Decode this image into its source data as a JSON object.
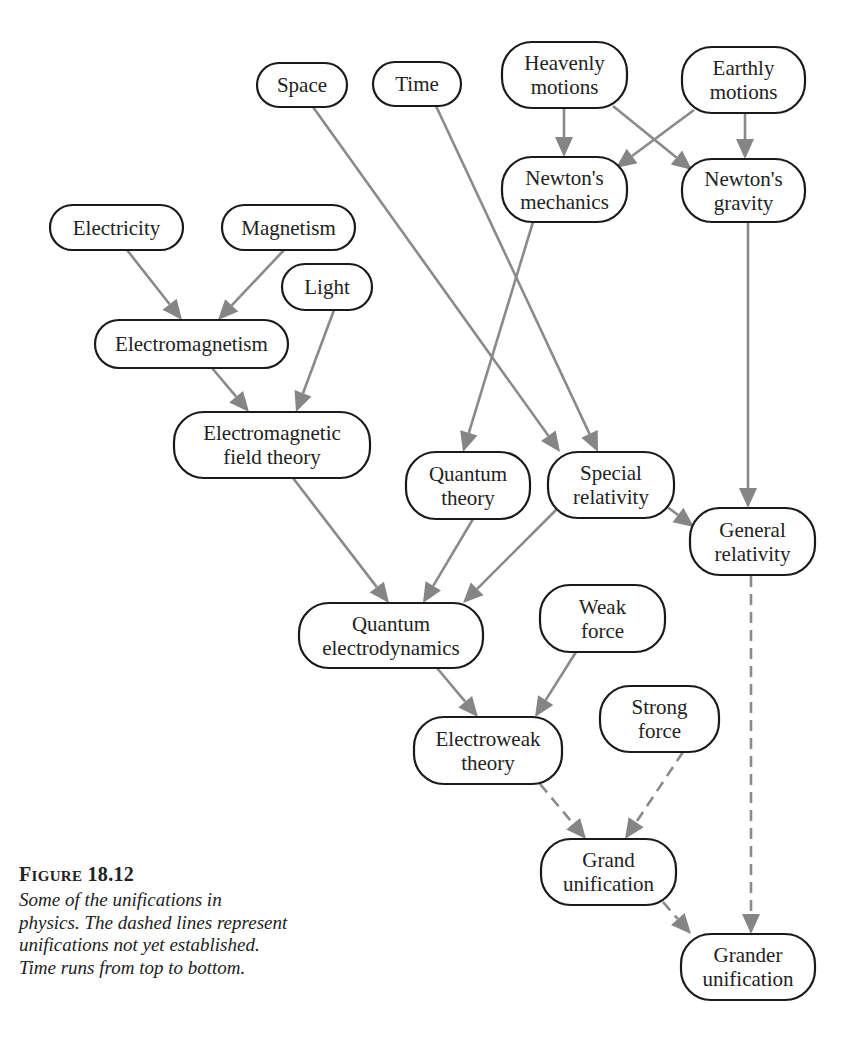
{
  "diagram": {
    "title": "Unifications in physics",
    "edge_color": "#858585",
    "node_border_color": "#1a1a1a",
    "nodes": [
      {
        "id": "space",
        "lines": [
          "Space"
        ],
        "x": 257,
        "y": 63,
        "w": 90,
        "h": 44
      },
      {
        "id": "time",
        "lines": [
          "Time"
        ],
        "x": 373,
        "y": 62,
        "w": 88,
        "h": 44
      },
      {
        "id": "heavenly",
        "lines": [
          "Heavenly",
          "motions"
        ],
        "x": 502,
        "y": 42,
        "w": 125,
        "h": 66
      },
      {
        "id": "earthly",
        "lines": [
          "Earthly",
          "motions"
        ],
        "x": 682,
        "y": 47,
        "w": 123,
        "h": 66
      },
      {
        "id": "newton_mech",
        "lines": [
          "Newton's",
          "mechanics"
        ],
        "x": 502,
        "y": 157,
        "w": 125,
        "h": 65
      },
      {
        "id": "newton_grav",
        "lines": [
          "Newton's",
          "gravity"
        ],
        "x": 682,
        "y": 159,
        "w": 123,
        "h": 63
      },
      {
        "id": "electricity",
        "lines": [
          "Electricity"
        ],
        "x": 50,
        "y": 205,
        "w": 133,
        "h": 45
      },
      {
        "id": "magnetism",
        "lines": [
          "Magnetism"
        ],
        "x": 222,
        "y": 205,
        "w": 133,
        "h": 45
      },
      {
        "id": "light",
        "lines": [
          "Light"
        ],
        "x": 282,
        "y": 264,
        "w": 90,
        "h": 46
      },
      {
        "id": "electromagnetism",
        "lines": [
          "Electromagnetism"
        ],
        "x": 95,
        "y": 320,
        "w": 193,
        "h": 48
      },
      {
        "id": "em_field",
        "lines": [
          "Electromagnetic",
          "field theory"
        ],
        "x": 174,
        "y": 412,
        "w": 196,
        "h": 66
      },
      {
        "id": "quantum_theory",
        "lines": [
          "Quantum",
          "theory"
        ],
        "x": 406,
        "y": 452,
        "w": 124,
        "h": 67
      },
      {
        "id": "special_rel",
        "lines": [
          "Special",
          "relativity"
        ],
        "x": 548,
        "y": 452,
        "w": 126,
        "h": 66
      },
      {
        "id": "general_rel",
        "lines": [
          "General",
          "relativity"
        ],
        "x": 690,
        "y": 508,
        "w": 125,
        "h": 67
      },
      {
        "id": "qed",
        "lines": [
          "Quantum",
          "electrodynamics"
        ],
        "x": 299,
        "y": 603,
        "w": 184,
        "h": 65
      },
      {
        "id": "weak",
        "lines": [
          "Weak",
          "force"
        ],
        "x": 540,
        "y": 585,
        "w": 125,
        "h": 67
      },
      {
        "id": "electroweak",
        "lines": [
          "Electroweak",
          "theory"
        ],
        "x": 414,
        "y": 717,
        "w": 148,
        "h": 67
      },
      {
        "id": "strong",
        "lines": [
          "Strong",
          "force"
        ],
        "x": 600,
        "y": 686,
        "w": 119,
        "h": 66
      },
      {
        "id": "grand",
        "lines": [
          "Grand",
          "unification"
        ],
        "x": 541,
        "y": 839,
        "w": 135,
        "h": 66
      },
      {
        "id": "grander",
        "lines": [
          "Grander",
          "unification"
        ],
        "x": 681,
        "y": 934,
        "w": 134,
        "h": 66
      }
    ],
    "edges": [
      {
        "from": "heavenly",
        "to": "newton_mech",
        "dashed": false,
        "x1": 564,
        "y1": 108,
        "x2": 564,
        "y2": 157
      },
      {
        "from": "heavenly",
        "to": "newton_grav",
        "dashed": false,
        "x1": 613,
        "y1": 106,
        "x2": 692,
        "y2": 170
      },
      {
        "from": "earthly",
        "to": "newton_mech",
        "dashed": false,
        "x1": 694,
        "y1": 110,
        "x2": 616,
        "y2": 168
      },
      {
        "from": "earthly",
        "to": "newton_grav",
        "dashed": false,
        "x1": 745,
        "y1": 113,
        "x2": 745,
        "y2": 159
      },
      {
        "from": "space",
        "to": "special_rel",
        "dashed": false,
        "x1": 313,
        "y1": 107,
        "x2": 560,
        "y2": 452
      },
      {
        "from": "time",
        "to": "special_rel",
        "dashed": false,
        "x1": 436,
        "y1": 106,
        "x2": 598,
        "y2": 452
      },
      {
        "from": "newton_mech",
        "to": "quantum_theory",
        "dashed": false,
        "x1": 533,
        "y1": 222,
        "x2": 463,
        "y2": 452
      },
      {
        "from": "newton_grav",
        "to": "general_rel",
        "dashed": false,
        "x1": 748,
        "y1": 222,
        "x2": 748,
        "y2": 508
      },
      {
        "from": "electricity",
        "to": "electromagnetism",
        "dashed": false,
        "x1": 127,
        "y1": 250,
        "x2": 182,
        "y2": 320
      },
      {
        "from": "magnetism",
        "to": "electromagnetism",
        "dashed": false,
        "x1": 284,
        "y1": 250,
        "x2": 218,
        "y2": 320
      },
      {
        "from": "electromagnetism",
        "to": "em_field",
        "dashed": false,
        "x1": 212,
        "y1": 368,
        "x2": 249,
        "y2": 412
      },
      {
        "from": "light",
        "to": "em_field",
        "dashed": false,
        "x1": 334,
        "y1": 310,
        "x2": 296,
        "y2": 412
      },
      {
        "from": "em_field",
        "to": "qed",
        "dashed": false,
        "x1": 293,
        "y1": 478,
        "x2": 389,
        "y2": 603
      },
      {
        "from": "quantum_theory",
        "to": "qed",
        "dashed": false,
        "x1": 473,
        "y1": 519,
        "x2": 423,
        "y2": 603
      },
      {
        "from": "special_rel",
        "to": "qed",
        "dashed": false,
        "x1": 556,
        "y1": 510,
        "x2": 463,
        "y2": 603
      },
      {
        "from": "special_rel",
        "to": "general_rel",
        "dashed": false,
        "x1": 666,
        "y1": 506,
        "x2": 694,
        "y2": 527
      },
      {
        "from": "qed",
        "to": "electroweak",
        "dashed": false,
        "x1": 437,
        "y1": 668,
        "x2": 478,
        "y2": 717
      },
      {
        "from": "weak",
        "to": "electroweak",
        "dashed": false,
        "x1": 576,
        "y1": 652,
        "x2": 535,
        "y2": 717
      },
      {
        "from": "electroweak",
        "to": "grand",
        "dashed": true,
        "x1": 540,
        "y1": 784,
        "x2": 586,
        "y2": 839
      },
      {
        "from": "strong",
        "to": "grand",
        "dashed": true,
        "x1": 683,
        "y1": 752,
        "x2": 625,
        "y2": 839
      },
      {
        "from": "grand",
        "to": "grander",
        "dashed": true,
        "x1": 663,
        "y1": 902,
        "x2": 691,
        "y2": 934
      },
      {
        "from": "general_rel",
        "to": "grander",
        "dashed": true,
        "x1": 751,
        "y1": 576,
        "x2": 751,
        "y2": 934
      }
    ]
  },
  "caption": {
    "label_prefix": "F",
    "label_smallcaps": "IGURE",
    "label_number": "18.12",
    "lines": [
      "Some of the unifications in",
      "physics. The dashed lines represent",
      "unifications not yet established.",
      "Time runs from top to bottom."
    ]
  }
}
